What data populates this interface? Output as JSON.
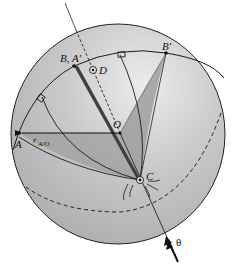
{
  "diagram": {
    "type": "rigid-body rotation on a sphere (Euler's theorem)",
    "colors": {
      "sphere_fill": "#b9b9b9",
      "sphere_highlight": "#e6e6e6",
      "plane_shade": "#9c9c9c",
      "dark_wedge": "#4a4a4a",
      "line": "#1a1a1a"
    },
    "labels": {
      "point_A": "A",
      "point_B_A_prime": "B, A′",
      "point_B_prime": "B′",
      "point_O": "O",
      "point_C": "C",
      "point_D": "D",
      "vector_r_main": "r",
      "vector_r_sub": "A/O",
      "angle": "θ"
    },
    "points": [
      {
        "name": "A",
        "x": 19,
        "y": 133
      },
      {
        "name": "B, A′",
        "x": 74,
        "y": 66
      },
      {
        "name": "B′",
        "x": 166,
        "y": 53
      },
      {
        "name": "O",
        "x": 120,
        "y": 133
      },
      {
        "name": "C",
        "x": 140,
        "y": 180
      },
      {
        "name": "D",
        "x": 94,
        "y": 70
      }
    ],
    "elements": [
      "sphere outline",
      "great circle arc through A, B/A′, B′",
      "dashed hidden great circle arc",
      "rotation axis through C with arrow labelled θ",
      "dashed line from O toward D",
      "vector r_A/O from O to A",
      "dark wedge from B/A′ to C",
      "shaded wedge from B′ to C",
      "right-angle markers on two meridians",
      "curved rotation marks around C"
    ]
  }
}
